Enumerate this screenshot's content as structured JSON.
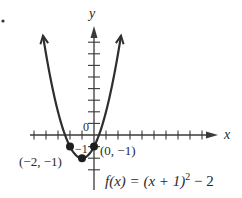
{
  "bullet": "•",
  "chart_data": {
    "type": "line",
    "title": "",
    "function_label": "f(x) = (x + 1)² − 2",
    "function_parts": {
      "prefix": "f(x) = (x + 1)",
      "exponent": "2",
      "suffix": " − 2"
    },
    "xlabel": "x",
    "ylabel": "y",
    "origin_label": "0",
    "y_tick_label": "−1",
    "xlim": [
      -5,
      10
    ],
    "ylim": [
      -4,
      9
    ],
    "grid": false,
    "x_ticks": [
      -5,
      -4,
      -3,
      -2,
      -1,
      1,
      2,
      3,
      4,
      5,
      6,
      7,
      8,
      9
    ],
    "y_ticks": [
      -3,
      -2,
      -1,
      1,
      2,
      3,
      4,
      5,
      6,
      7,
      8
    ],
    "curve": {
      "equation": "(x+1)^2-2",
      "x_range": [
        -4.25,
        2.25
      ],
      "arrows_at_ends": true
    },
    "points": [
      {
        "x": -2,
        "y": -1,
        "label": "(−2, −1)"
      },
      {
        "x": -1,
        "y": -2,
        "label": ""
      },
      {
        "x": 0,
        "y": -1,
        "label": "(0, −1)"
      }
    ],
    "vertex": {
      "x": -1,
      "y": -2
    }
  }
}
